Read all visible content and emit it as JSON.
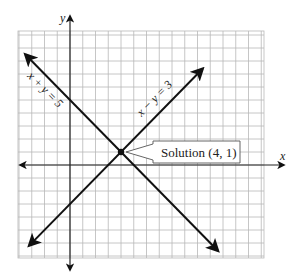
{
  "figure": {
    "axes": {
      "x_label": "x",
      "y_label": "y"
    },
    "grid": {
      "x_min": -4,
      "x_max": 15,
      "y_min": -7,
      "y_max": 10,
      "step": 1,
      "color": "#b8b8b8"
    },
    "lines": [
      {
        "id": "line-sum",
        "equation": "x + y = 5",
        "label": "x + y = 5",
        "slope": -1,
        "intercept": 5,
        "color": "#111111"
      },
      {
        "id": "line-diff",
        "equation": "x − y = 3",
        "label": "x − y = 3",
        "slope": 1,
        "intercept": -3,
        "color": "#111111"
      }
    ],
    "solution": {
      "x": 4,
      "y": 1,
      "label": "Solution (4, 1)"
    }
  },
  "chart_data": {
    "type": "line",
    "title": "",
    "xlabel": "x",
    "ylabel": "y",
    "grid": true,
    "series": [
      {
        "name": "x + y = 5",
        "points": [
          [
            -3,
            8
          ],
          [
            4,
            1
          ],
          [
            11,
            -6
          ]
        ]
      },
      {
        "name": "x − y = 3",
        "points": [
          [
            -3,
            -6
          ],
          [
            4,
            1
          ],
          [
            11,
            8
          ]
        ]
      }
    ],
    "annotations": [
      {
        "text": "Solution (4, 1)",
        "x": 4,
        "y": 1
      }
    ]
  }
}
